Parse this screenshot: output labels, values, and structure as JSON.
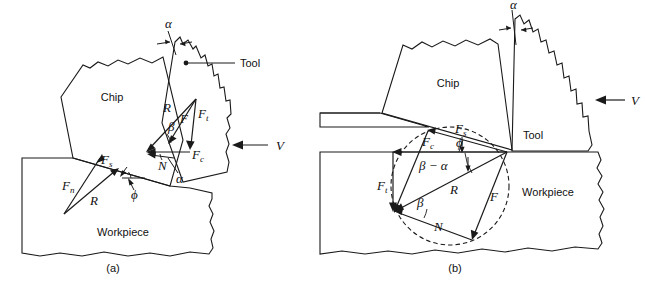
{
  "figure": {
    "type": "technical-diagram",
    "background_color": "#ffffff",
    "colors": {
      "chip_fill": "#b3b3b3",
      "tool_fill": "#9b9b9b",
      "workpiece_fill": "#e3e3e3",
      "outline": "#1a1a1a",
      "text": "#111111"
    },
    "captions": [
      {
        "id": "a",
        "text": "(a)"
      },
      {
        "id": "b",
        "text": "(b)"
      }
    ]
  },
  "panel_a": {
    "caption": "(a)",
    "regions": {
      "chip": "Chip",
      "tool": "Tool",
      "workpiece": "Workpiece"
    },
    "callout": {
      "label": "Tool"
    },
    "velocity": {
      "label": "V",
      "direction": "left"
    },
    "angles": {
      "rake": "α",
      "rake_lower": "α",
      "friction": "β",
      "shear": "ϕ"
    },
    "forces": {
      "resultant_tool": "R",
      "friction": "F",
      "thrust": "F",
      "thrust_sub": "t",
      "cutting": "F",
      "cutting_sub": "c",
      "normal": "N",
      "shear": "F",
      "shear_sub": "s",
      "normal_shear": "F",
      "normal_shear_sub": "n",
      "resultant_shear": "R"
    }
  },
  "panel_b": {
    "caption": "(b)",
    "regions": {
      "chip": "Chip",
      "tool": "Tool",
      "workpiece": "Workpiece"
    },
    "velocity": {
      "label": "V",
      "direction": "left"
    },
    "angles": {
      "rake": "α",
      "friction": "β",
      "shear": "ϕ",
      "beta_minus_alpha": "β − α"
    },
    "forces": {
      "shear": "F",
      "shear_sub": "s",
      "cutting": "F",
      "cutting_sub": "c",
      "thrust": "F",
      "thrust_sub": "t",
      "resultant": "R",
      "friction": "F",
      "normal": "N"
    },
    "circle": {
      "style": "dashed",
      "name": "merchant-force-circle"
    }
  }
}
